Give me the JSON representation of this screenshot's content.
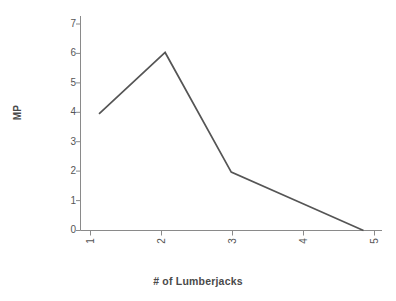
{
  "chart_data": {
    "type": "line",
    "title": "",
    "xlabel": "# of Lumberjacks",
    "ylabel": "MP",
    "x": [
      1,
      2,
      3,
      4,
      5
    ],
    "values": [
      4,
      6.1,
      2,
      1,
      0
    ],
    "series": [
      {
        "name": "MP",
        "values": [
          4,
          6.1,
          2,
          1,
          0
        ]
      }
    ],
    "xtick_labels": [
      "1",
      "2",
      "3",
      "4",
      "5"
    ],
    "ytick_labels": [
      "0",
      "1",
      "2",
      "3",
      "4",
      "5",
      "6",
      "7"
    ],
    "xlim": [
      0.72,
      5.28
    ],
    "ylim": [
      0,
      7.35
    ],
    "grid": false,
    "legend": false,
    "legend_position": "none",
    "markers": false,
    "xtick_label_rotation": 90,
    "ylabel_rotation": 90,
    "line_color": "#555555",
    "axis_color": "#8a8a8a",
    "text_color": "#555555",
    "background_color": "#ffffff"
  }
}
